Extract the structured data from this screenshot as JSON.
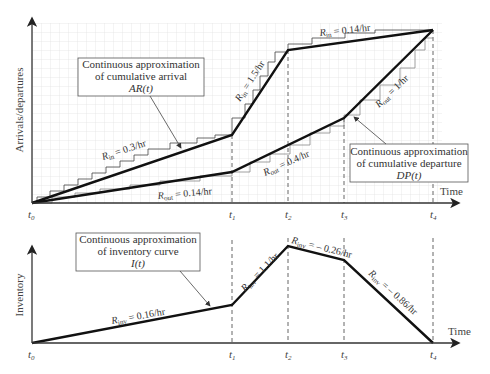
{
  "figure": {
    "top_chart": {
      "y_axis_label": "Arrivals/departures",
      "x_axis_label": "Time",
      "tick_labels": [
        "t0",
        "t1",
        "t2",
        "t3",
        "t4"
      ],
      "arrival_callout": {
        "line1": "Continuous approximation",
        "line2": "of cumulative arrival",
        "line3": "AR(t)"
      },
      "departure_callout": {
        "line1": "Continuous approximation",
        "line2": "of cumulative departure",
        "line3": "DP(t)"
      },
      "rates": {
        "rin_1": "R",
        "rin_1_sub": "in",
        "rin_1_val": " = 0.3/hr",
        "rin_2": "R",
        "rin_2_sub": "in",
        "rin_2_val": " = 1.5/hr",
        "rin_3": "R",
        "rin_3_sub": "in",
        "rin_3_val": " = 0.14/hr",
        "rout_1": "R",
        "rout_1_sub": "out",
        "rout_1_val": " = 0.14/hr",
        "rout_2": "R",
        "rout_2_sub": "out",
        "rout_2_val": " = 0.4/hr",
        "rout_3": "R",
        "rout_3_sub": "out",
        "rout_3_val": " = 1/hr"
      }
    },
    "bottom_chart": {
      "y_axis_label": "Inventory",
      "x_axis_label": "Time",
      "tick_labels": [
        "t0",
        "t1",
        "t2",
        "t3",
        "t4"
      ],
      "inventory_callout": {
        "line1": "Continuous approximation",
        "line2": "of inventory curve",
        "line3": "I(t)"
      },
      "rates": {
        "r1": "R",
        "r1_sub": "inv",
        "r1_val": " = 0.16/hr",
        "r2": "R",
        "r2_sub": "inv",
        "r2_val": " = 1.1/hr",
        "r3": "R",
        "r3_sub": "inv",
        "r3_val": " = – 0.26/hr",
        "r4": "R",
        "r4_sub": "inv",
        "r4_val": " = – 0.86/hr"
      }
    },
    "colors": {
      "line": "#111111",
      "grid": "#d6d6d6",
      "axis": "#333333",
      "dashed": "#555555"
    }
  }
}
